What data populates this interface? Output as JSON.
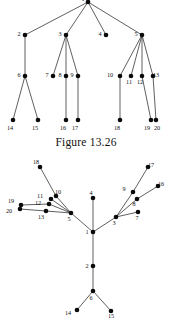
{
  "page": {
    "background_color": "#ffffff",
    "width": 172,
    "height": 331,
    "node_color": "#0a0a0a",
    "edge_color": "#2b2b2b",
    "text_color": "#111111"
  },
  "figures": [
    {
      "id": "figure-13-26",
      "caption": "Figure 13.26",
      "type": "rooted-tree",
      "description": "Rooted tree drawn top-down with root node 1 at top, levels of children below.",
      "nodes": [
        {
          "id": "1",
          "label": "1",
          "x": 88,
          "y": 2,
          "label_dx": -5,
          "label_dy": -1,
          "level": 0
        },
        {
          "id": "2",
          "label": "2",
          "x": 25,
          "y": 35,
          "label_dx": -6,
          "label_dy": 1,
          "level": 1
        },
        {
          "id": "3",
          "label": "3",
          "x": 66,
          "y": 35,
          "label_dx": -6,
          "label_dy": 1,
          "level": 1
        },
        {
          "id": "4",
          "label": "4",
          "x": 106,
          "y": 35,
          "label_dx": -6,
          "label_dy": 1,
          "level": 1
        },
        {
          "id": "5",
          "label": "5",
          "x": 142,
          "y": 35,
          "label_dx": -6,
          "label_dy": 1,
          "level": 1
        },
        {
          "id": "6",
          "label": "6",
          "x": 25,
          "y": 76,
          "label_dx": -6,
          "label_dy": 1,
          "level": 2
        },
        {
          "id": "7",
          "label": "7",
          "x": 53,
          "y": 76,
          "label_dx": -6,
          "label_dy": 1,
          "level": 2
        },
        {
          "id": "8",
          "label": "8",
          "x": 66,
          "y": 76,
          "label_dx": -6,
          "label_dy": 1,
          "level": 2
        },
        {
          "id": "9",
          "label": "9",
          "x": 78,
          "y": 76,
          "label_dx": -6,
          "label_dy": 1,
          "level": 2
        },
        {
          "id": "10",
          "label": "10",
          "x": 120,
          "y": 76,
          "label_dx": -10,
          "label_dy": 1,
          "level": 2
        },
        {
          "id": "11",
          "label": "11",
          "x": 131,
          "y": 76,
          "label_dx": -2,
          "label_dy": 8,
          "level": 2
        },
        {
          "id": "12",
          "label": "12",
          "x": 142,
          "y": 76,
          "label_dx": -2,
          "label_dy": 8,
          "level": 2
        },
        {
          "id": "13",
          "label": "13",
          "x": 153,
          "y": 76,
          "label_dx": 3,
          "label_dy": 1,
          "level": 2
        },
        {
          "id": "14",
          "label": "14",
          "x": 13,
          "y": 120,
          "label_dx": -3,
          "label_dy": 10,
          "level": 3
        },
        {
          "id": "15",
          "label": "15",
          "x": 38,
          "y": 120,
          "label_dx": -3,
          "label_dy": 10,
          "level": 3
        },
        {
          "id": "16",
          "label": "16",
          "x": 66,
          "y": 120,
          "label_dx": -3,
          "label_dy": 10,
          "level": 3
        },
        {
          "id": "17",
          "label": "17",
          "x": 78,
          "y": 120,
          "label_dx": -3,
          "label_dy": 10,
          "level": 3
        },
        {
          "id": "18",
          "label": "18",
          "x": 120,
          "y": 120,
          "label_dx": -3,
          "label_dy": 10,
          "level": 3
        },
        {
          "id": "19",
          "label": "19",
          "x": 151,
          "y": 120,
          "label_dx": -4,
          "label_dy": 10,
          "level": 3
        },
        {
          "id": "20",
          "label": "20",
          "x": 156,
          "y": 120,
          "label_dx": 1,
          "label_dy": 10,
          "level": 3
        }
      ],
      "edges": [
        [
          "1",
          "2"
        ],
        [
          "1",
          "3"
        ],
        [
          "1",
          "4"
        ],
        [
          "1",
          "5"
        ],
        [
          "2",
          "6"
        ],
        [
          "3",
          "7"
        ],
        [
          "3",
          "8"
        ],
        [
          "3",
          "9"
        ],
        [
          "5",
          "10"
        ],
        [
          "5",
          "11"
        ],
        [
          "5",
          "12"
        ],
        [
          "5",
          "13"
        ],
        [
          "6",
          "14"
        ],
        [
          "6",
          "15"
        ],
        [
          "8",
          "16"
        ],
        [
          "9",
          "17"
        ],
        [
          "10",
          "18"
        ],
        [
          "12",
          "19"
        ],
        [
          "13",
          "20"
        ]
      ]
    },
    {
      "id": "figure-free-tree",
      "caption": "",
      "type": "free-tree",
      "description": "Same tree redrawn as a free (unrooted) tree with node 1 near the center.",
      "nodes": [
        {
          "id": "1",
          "label": "1",
          "x": 93,
          "y": 232,
          "label_dx": -6,
          "label_dy": 2,
          "level": 0
        },
        {
          "id": "2",
          "label": "2",
          "x": 93,
          "y": 266,
          "label_dx": -6,
          "label_dy": 2,
          "level": 1
        },
        {
          "id": "3",
          "label": "3",
          "x": 116,
          "y": 217,
          "label_dx": -2,
          "label_dy": 8,
          "level": 1
        },
        {
          "id": "4",
          "label": "4",
          "x": 93,
          "y": 198,
          "label_dx": -2,
          "label_dy": -3,
          "level": 1
        },
        {
          "id": "5",
          "label": "5",
          "x": 71,
          "y": 213,
          "label_dx": -2,
          "label_dy": 8,
          "level": 1
        },
        {
          "id": "6",
          "label": "6",
          "x": 93,
          "y": 291,
          "label_dx": -2,
          "label_dy": 9,
          "level": 2
        },
        {
          "id": "7",
          "label": "7",
          "x": 138,
          "y": 212,
          "label_dx": -1,
          "label_dy": 8,
          "level": 2
        },
        {
          "id": "8",
          "label": "8",
          "x": 137,
          "y": 199,
          "label_dx": -3,
          "label_dy": 7,
          "level": 2
        },
        {
          "id": "9",
          "label": "9",
          "x": 133,
          "y": 192,
          "label_dx": -9,
          "label_dy": -1,
          "level": 2
        },
        {
          "id": "10",
          "label": "10",
          "x": 56,
          "y": 196,
          "label_dx": 2,
          "label_dy": -2,
          "level": 2
        },
        {
          "id": "11",
          "label": "11",
          "x": 51,
          "y": 199,
          "label_dx": -11,
          "label_dy": -1,
          "level": 2
        },
        {
          "id": "12",
          "label": "12",
          "x": 49,
          "y": 204,
          "label_dx": -11,
          "label_dy": 1,
          "level": 2
        },
        {
          "id": "13",
          "label": "13",
          "x": 46,
          "y": 211,
          "label_dx": -5,
          "label_dy": 8,
          "level": 2
        },
        {
          "id": "14",
          "label": "14",
          "x": 77,
          "y": 310,
          "label_dx": -9,
          "label_dy": 5,
          "level": 3
        },
        {
          "id": "15",
          "label": "15",
          "x": 111,
          "y": 311,
          "label_dx": 0,
          "label_dy": 7,
          "level": 3
        },
        {
          "id": "16",
          "label": "16",
          "x": 158,
          "y": 186,
          "label_dx": 3,
          "label_dy": 0,
          "level": 3
        },
        {
          "id": "17",
          "label": "17",
          "x": 148,
          "y": 167,
          "label_dx": 3,
          "label_dy": 0,
          "level": 3
        },
        {
          "id": "18",
          "label": "18",
          "x": 40,
          "y": 167,
          "label_dx": -4,
          "label_dy": -3,
          "level": 3
        },
        {
          "id": "19",
          "label": "19",
          "x": 21,
          "y": 205,
          "label_dx": -10,
          "label_dy": -2,
          "level": 3
        },
        {
          "id": "20",
          "label": "20",
          "x": 20,
          "y": 209,
          "label_dx": -11,
          "label_dy": 4,
          "level": 3
        }
      ],
      "edges": [
        [
          "1",
          "2"
        ],
        [
          "1",
          "3"
        ],
        [
          "1",
          "4"
        ],
        [
          "1",
          "5"
        ],
        [
          "2",
          "6"
        ],
        [
          "3",
          "7"
        ],
        [
          "3",
          "8"
        ],
        [
          "3",
          "9"
        ],
        [
          "5",
          "10"
        ],
        [
          "5",
          "11"
        ],
        [
          "5",
          "12"
        ],
        [
          "5",
          "13"
        ],
        [
          "6",
          "14"
        ],
        [
          "6",
          "15"
        ],
        [
          "8",
          "16"
        ],
        [
          "9",
          "17"
        ],
        [
          "10",
          "18"
        ],
        [
          "12",
          "19"
        ],
        [
          "13",
          "20"
        ]
      ]
    }
  ]
}
